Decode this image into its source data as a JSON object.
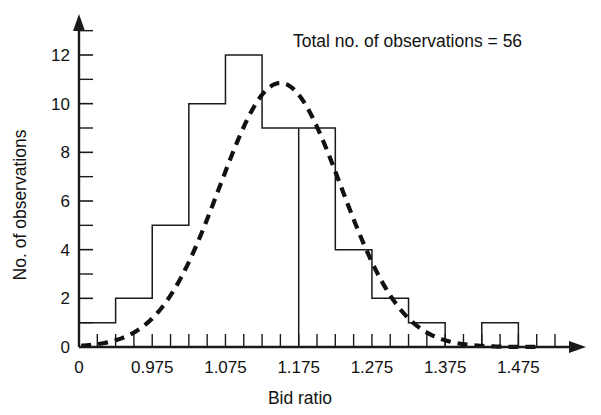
{
  "chart_data": {
    "type": "bar",
    "title": "",
    "annotation": "Total no. of observations = 56",
    "xlabel": "Bid ratio",
    "ylabel": "No. of observations",
    "xlim": [
      0.875,
      1.525
    ],
    "ylim": [
      0,
      13
    ],
    "grid": false,
    "legend": "none",
    "bin_width": 0.05,
    "categories": [
      "0.875-0.925",
      "0.925-0.975",
      "0.975-1.025",
      "1.025-1.075",
      "1.075-1.125",
      "1.125-1.175",
      "1.175-1.225",
      "1.225-1.275",
      "1.275-1.325",
      "1.325-1.375",
      "1.375-1.425",
      "1.425-1.475"
    ],
    "bin_edges": [
      0.875,
      0.925,
      0.975,
      1.025,
      1.075,
      1.125,
      1.175,
      1.225,
      1.275,
      1.325,
      1.375,
      1.425,
      1.475
    ],
    "values": [
      1,
      2,
      5,
      10,
      12,
      9,
      9,
      4,
      2,
      1,
      0,
      1
    ],
    "x_tick_labels": [
      "0",
      "0.975",
      "1.075",
      "1.175",
      "1.275",
      "1.375",
      "1.475"
    ],
    "x_tick_values": [
      0.875,
      0.975,
      1.075,
      1.175,
      1.275,
      1.375,
      1.475
    ],
    "y_tick_labels": [
      "0",
      "2",
      "4",
      "6",
      "8",
      "10",
      "12"
    ],
    "y_tick_values": [
      0,
      2,
      4,
      6,
      8,
      10,
      12
    ],
    "y_minor_tick_values": [
      1,
      3,
      5,
      7,
      9,
      11,
      13
    ],
    "x_minor_tick_step": 0.025,
    "curve": {
      "type": "normal-fit",
      "style": "dashed",
      "peak_x": 1.15,
      "peak_y": 10.85,
      "mean": 1.15,
      "sigma": 0.083,
      "amplitude": 10.85
    },
    "colors": {
      "axis": "#1a1a1a",
      "bar_stroke": "#1a1a1a",
      "bar_fill": "#ffffff",
      "curve": "#111111",
      "text": "#111111",
      "background": "#ffffff"
    }
  }
}
